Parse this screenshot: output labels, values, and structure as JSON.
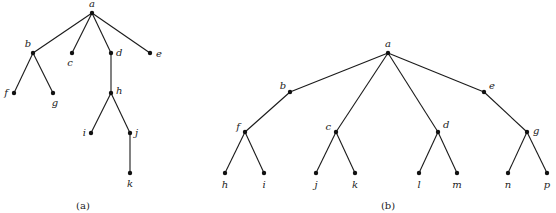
{
  "figures": [
    {
      "id": "a",
      "caption": "(a)",
      "caption_pos": [
        83,
        209
      ],
      "nodes": [
        {
          "name": "a",
          "x": 92,
          "y": 13,
          "lx": 92,
          "ly": 7,
          "anchor": "middle"
        },
        {
          "name": "b",
          "x": 33,
          "y": 53,
          "lx": 28,
          "ly": 47,
          "anchor": "middle"
        },
        {
          "name": "c",
          "x": 72,
          "y": 53,
          "lx": 70,
          "ly": 66,
          "anchor": "middle"
        },
        {
          "name": "d",
          "x": 111,
          "y": 53,
          "lx": 116,
          "ly": 56,
          "anchor": "start"
        },
        {
          "name": "e",
          "x": 150,
          "y": 53,
          "lx": 156,
          "ly": 57,
          "anchor": "start"
        },
        {
          "name": "f",
          "x": 14,
          "y": 93,
          "lx": 8,
          "ly": 96,
          "anchor": "end"
        },
        {
          "name": "g",
          "x": 53,
          "y": 93,
          "lx": 55,
          "ly": 106,
          "anchor": "middle"
        },
        {
          "name": "h",
          "x": 111,
          "y": 93,
          "lx": 116,
          "ly": 94,
          "anchor": "start"
        },
        {
          "name": "i",
          "x": 91,
          "y": 133,
          "lx": 86,
          "ly": 136,
          "anchor": "end"
        },
        {
          "name": "j",
          "x": 130,
          "y": 133,
          "lx": 135,
          "ly": 136,
          "anchor": "start"
        },
        {
          "name": "k",
          "x": 130,
          "y": 173,
          "lx": 130,
          "ly": 187,
          "anchor": "middle"
        }
      ],
      "edges": [
        [
          "a",
          "b"
        ],
        [
          "a",
          "c"
        ],
        [
          "a",
          "d"
        ],
        [
          "a",
          "e"
        ],
        [
          "b",
          "f"
        ],
        [
          "b",
          "g"
        ],
        [
          "d",
          "h"
        ],
        [
          "h",
          "i"
        ],
        [
          "h",
          "j"
        ],
        [
          "j",
          "k"
        ]
      ]
    },
    {
      "id": "b",
      "caption": "(b)",
      "caption_pos": [
        388,
        209
      ],
      "nodes": [
        {
          "name": "a",
          "x": 388,
          "y": 53,
          "lx": 388,
          "ly": 47,
          "anchor": "middle"
        },
        {
          "name": "b",
          "x": 290,
          "y": 92,
          "lx": 283,
          "ly": 89,
          "anchor": "middle"
        },
        {
          "name": "e",
          "x": 484,
          "y": 92,
          "lx": 489,
          "ly": 89,
          "anchor": "start"
        },
        {
          "name": "f",
          "x": 245,
          "y": 132,
          "lx": 240,
          "ly": 130,
          "anchor": "end"
        },
        {
          "name": "c",
          "x": 336,
          "y": 132,
          "lx": 331,
          "ly": 130,
          "anchor": "end"
        },
        {
          "name": "d",
          "x": 438,
          "y": 132,
          "lx": 443,
          "ly": 128,
          "anchor": "start"
        },
        {
          "name": "g",
          "x": 527,
          "y": 132,
          "lx": 533,
          "ly": 134,
          "anchor": "start"
        },
        {
          "name": "h",
          "x": 225,
          "y": 173,
          "lx": 225,
          "ly": 188,
          "anchor": "middle"
        },
        {
          "name": "i",
          "x": 264,
          "y": 173,
          "lx": 264,
          "ly": 188,
          "anchor": "middle"
        },
        {
          "name": "j",
          "x": 316,
          "y": 173,
          "lx": 316,
          "ly": 188,
          "anchor": "middle"
        },
        {
          "name": "k",
          "x": 355,
          "y": 173,
          "lx": 355,
          "ly": 188,
          "anchor": "middle"
        },
        {
          "name": "l",
          "x": 419,
          "y": 173,
          "lx": 419,
          "ly": 188,
          "anchor": "middle"
        },
        {
          "name": "m",
          "x": 457,
          "y": 173,
          "lx": 457,
          "ly": 188,
          "anchor": "middle"
        },
        {
          "name": "n",
          "x": 508,
          "y": 173,
          "lx": 508,
          "ly": 188,
          "anchor": "middle"
        },
        {
          "name": "p",
          "x": 547,
          "y": 173,
          "lx": 547,
          "ly": 188,
          "anchor": "middle"
        }
      ],
      "edges": [
        [
          "a",
          "b"
        ],
        [
          "a",
          "c"
        ],
        [
          "a",
          "d"
        ],
        [
          "a",
          "e"
        ],
        [
          "b",
          "f"
        ],
        [
          "e",
          "g"
        ],
        [
          "f",
          "h"
        ],
        [
          "f",
          "i"
        ],
        [
          "c",
          "j"
        ],
        [
          "c",
          "k"
        ],
        [
          "d",
          "l"
        ],
        [
          "d",
          "m"
        ],
        [
          "g",
          "n"
        ],
        [
          "g",
          "p"
        ]
      ]
    }
  ]
}
